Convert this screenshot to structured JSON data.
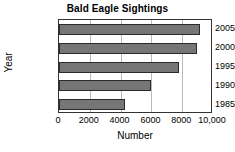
{
  "chart_data": {
    "type": "bar",
    "orientation": "horizontal",
    "title": "Bald Eagle Sightings",
    "xlabel": "Number",
    "ylabel": "Year",
    "categories": [
      "1985",
      "1990",
      "1995",
      "2000",
      "2005"
    ],
    "values": [
      4300,
      6000,
      7800,
      8950,
      9150
    ],
    "xlim": [
      0,
      10000
    ],
    "xticks": [
      0,
      2000,
      4000,
      6000,
      8000,
      10000
    ],
    "xtick_labels": [
      "0",
      "2000",
      "4000",
      "6000",
      "8000",
      "10,000"
    ],
    "grid": "vertical",
    "legend": null,
    "bar_color": "#767676",
    "bar_edge_color": "#2b2b2b",
    "axis_color": "#333333",
    "grid_color": "#b9b9b9",
    "background": "#ffffff"
  }
}
